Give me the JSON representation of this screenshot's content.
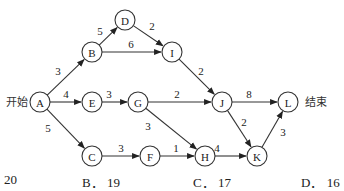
{
  "diagram": {
    "start_label": "开始",
    "end_label": "结束",
    "nodes": [
      {
        "id": "A",
        "x": 40,
        "y": 102
      },
      {
        "id": "B",
        "x": 92,
        "y": 52
      },
      {
        "id": "D",
        "x": 125,
        "y": 20
      },
      {
        "id": "I",
        "x": 172,
        "y": 52
      },
      {
        "id": "E",
        "x": 92,
        "y": 102
      },
      {
        "id": "G",
        "x": 138,
        "y": 102
      },
      {
        "id": "J",
        "x": 222,
        "y": 102
      },
      {
        "id": "L",
        "x": 288,
        "y": 102
      },
      {
        "id": "C",
        "x": 92,
        "y": 156
      },
      {
        "id": "F",
        "x": 150,
        "y": 156
      },
      {
        "id": "H",
        "x": 205,
        "y": 156
      },
      {
        "id": "K",
        "x": 257,
        "y": 156
      }
    ],
    "edges": [
      {
        "from": "A",
        "to": "B",
        "weight": "3",
        "lx": 58,
        "ly": 75
      },
      {
        "from": "A",
        "to": "E",
        "weight": "4",
        "lx": 66,
        "ly": 98
      },
      {
        "from": "A",
        "to": "C",
        "weight": "5",
        "lx": 48,
        "ly": 132
      },
      {
        "from": "B",
        "to": "D",
        "weight": "5",
        "lx": 100,
        "ly": 35
      },
      {
        "from": "B",
        "to": "I",
        "weight": "6",
        "lx": 131,
        "ly": 48
      },
      {
        "from": "D",
        "to": "I",
        "weight": "2",
        "lx": 152,
        "ly": 30
      },
      {
        "from": "I",
        "to": "J",
        "weight": "2",
        "lx": 201,
        "ly": 75
      },
      {
        "from": "E",
        "to": "G",
        "weight": "3",
        "lx": 109,
        "ly": 98
      },
      {
        "from": "G",
        "to": "J",
        "weight": "2",
        "lx": 177,
        "ly": 98
      },
      {
        "from": "G",
        "to": "H",
        "weight": "3",
        "lx": 148,
        "ly": 130
      },
      {
        "from": "C",
        "to": "F",
        "weight": "3",
        "lx": 121,
        "ly": 152
      },
      {
        "from": "F",
        "to": "H",
        "weight": "1",
        "lx": 176,
        "ly": 152
      },
      {
        "from": "H",
        "to": "K",
        "weight": "4",
        "lx": 217,
        "ly": 152
      },
      {
        "from": "J",
        "to": "L",
        "weight": "8",
        "lx": 249,
        "ly": 98
      },
      {
        "from": "J",
        "to": "K",
        "weight": "2",
        "lx": 244,
        "ly": 126
      },
      {
        "from": "K",
        "to": "L",
        "weight": "3",
        "lx": 283,
        "ly": 136
      }
    ]
  },
  "options": [
    {
      "label": "20",
      "x": 4
    },
    {
      "label": "B． 19",
      "x": 82
    },
    {
      "label": "C． 17",
      "x": 193
    },
    {
      "label": "D． 16",
      "x": 301
    }
  ]
}
